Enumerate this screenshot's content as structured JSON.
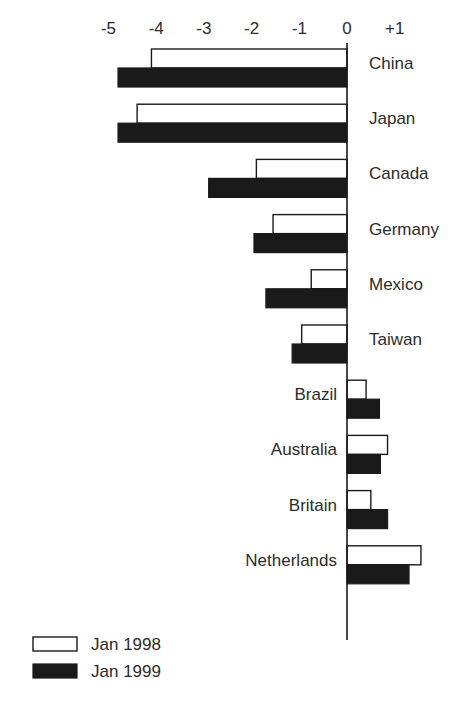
{
  "chart_data": {
    "type": "bar",
    "orientation": "horizontal",
    "title": "",
    "subtitle": "",
    "xlabel": "",
    "ylabel": "",
    "xlim": [
      -5.6,
      1.9
    ],
    "grid": false,
    "legend_position": "bottom-left",
    "tick_labels": [
      "-5",
      "-4",
      "-3",
      "-2",
      "-1",
      "0",
      "+1"
    ],
    "ticks": [
      -5,
      -4,
      -3,
      -2,
      -1,
      0,
      1
    ],
    "categories": [
      "China",
      "Japan",
      "Canada",
      "Germany",
      "Mexico",
      "Taiwan",
      "Brazil",
      "Australia",
      "Britain",
      "Netherlands"
    ],
    "series": [
      {
        "name": "Jan 1998",
        "style": "white",
        "values": [
          -4.1,
          -4.4,
          -1.9,
          -1.55,
          -0.75,
          -0.95,
          0.4,
          0.85,
          0.5,
          1.55
        ]
      },
      {
        "name": "Jan 1999",
        "style": "black",
        "values": [
          -4.8,
          -4.8,
          -2.9,
          -1.95,
          -1.7,
          -1.15,
          0.68,
          0.7,
          0.85,
          1.3
        ]
      }
    ]
  },
  "legend": {
    "items": [
      {
        "label": "Jan 1998",
        "swatch": "white"
      },
      {
        "label": "Jan 1999",
        "swatch": "black"
      }
    ]
  },
  "colors": {
    "bar_1998_fill": "#ffffff",
    "bar_1999_fill": "#1a1a1a",
    "stroke": "#1a1a1a",
    "text": "#2b2b2b",
    "background": "#ffffff"
  }
}
